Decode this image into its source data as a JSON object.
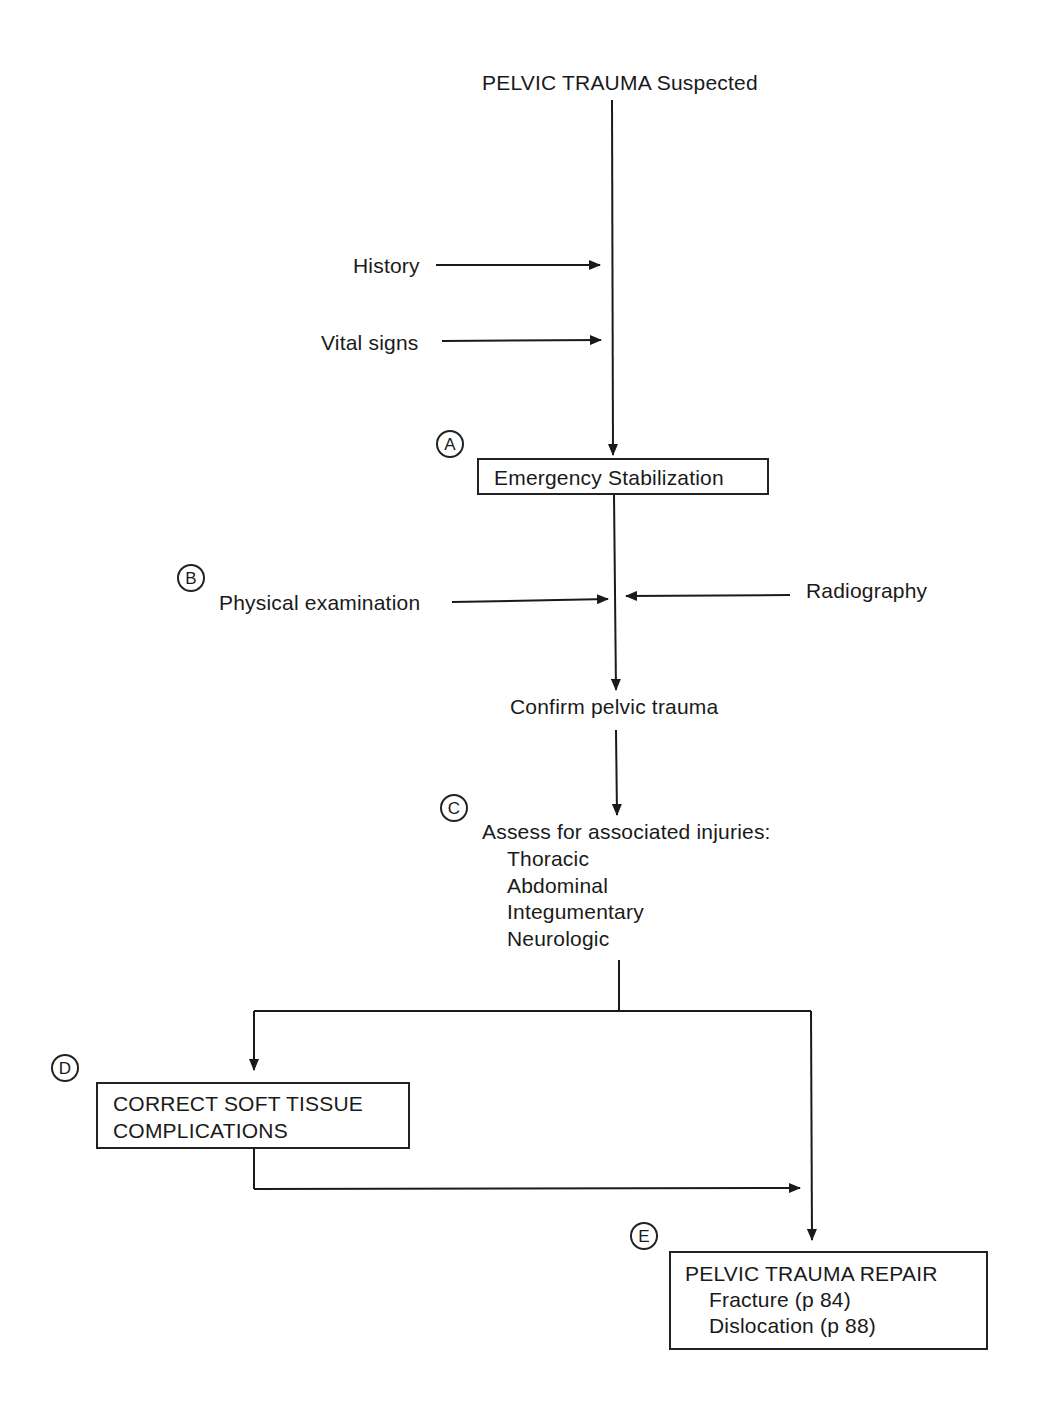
{
  "title": "PELVIC TRAUMA Suspected",
  "inputs_top": {
    "history": "History",
    "vital_signs": "Vital signs"
  },
  "steps": {
    "A": {
      "marker": "A",
      "label": "Emergency Stabilization"
    },
    "B": {
      "marker": "B",
      "left_input": "Physical examination",
      "right_input": "Radiography",
      "result": "Confirm pelvic trauma"
    },
    "C": {
      "marker": "C",
      "heading": "Assess for associated injuries:",
      "items": [
        "Thoracic",
        "Abdominal",
        "Integumentary",
        "Neurologic"
      ]
    },
    "D": {
      "marker": "D",
      "line1": "CORRECT SOFT TISSUE",
      "line2": "COMPLICATIONS"
    },
    "E": {
      "marker": "E",
      "heading": "PELVIC TRAUMA REPAIR",
      "items": [
        "Fracture (p 84)",
        "Dislocation (p 88)"
      ]
    }
  },
  "colors": {
    "ink": "#1a1a1a",
    "background": "#ffffff"
  }
}
